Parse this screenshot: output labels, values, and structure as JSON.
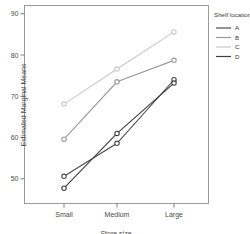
{
  "chart_data": {
    "type": "line",
    "title": "",
    "xlabel": "Store size",
    "ylabel": "Estimated Marginal Means",
    "categories": [
      "Small",
      "Medium",
      "Large"
    ],
    "ylim": [
      44,
      92
    ],
    "yticks": [
      50,
      60,
      70,
      80,
      90
    ],
    "ytick_labels": [
      "50",
      "60",
      "70",
      "80",
      "90"
    ],
    "grid": false,
    "legend_position": "right",
    "legend_title": "Shelf location",
    "series": [
      {
        "name": "A",
        "values": [
          50.6,
          58.6,
          74.0
        ],
        "color": "#4a4a4a"
      },
      {
        "name": "B",
        "values": [
          59.6,
          73.5,
          78.7
        ],
        "color": "#9a9a9a"
      },
      {
        "name": "C",
        "values": [
          68.1,
          76.6,
          85.6
        ],
        "color": "#c8c8c8"
      },
      {
        "name": "D",
        "values": [
          47.7,
          61.0,
          73.2
        ],
        "color": "#3d3d3d"
      }
    ]
  },
  "axis": {
    "y_title": "Estimated Marginal Means",
    "x_title": "Store size",
    "y_labels": [
      "90",
      "80",
      "70",
      "60",
      "50"
    ],
    "x_labels": [
      "Small",
      "Medium",
      "Large"
    ]
  },
  "legend": {
    "title": "Shelf location",
    "items": [
      {
        "label": "A"
      },
      {
        "label": "B"
      },
      {
        "label": "C"
      },
      {
        "label": "D"
      }
    ]
  }
}
